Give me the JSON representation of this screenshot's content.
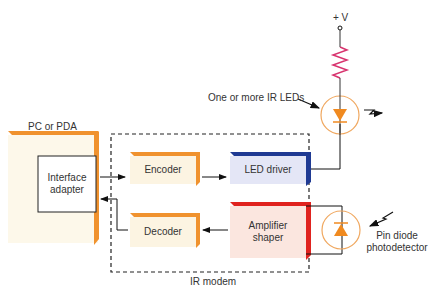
{
  "figure": {
    "pc": {
      "label": "PC or PDA",
      "fill": "#fdf8ea",
      "edge": "#f0922e"
    },
    "interface_adapter": {
      "label_line1": "Interface",
      "label_line2": "adapter"
    },
    "encoder": {
      "label": "Encoder",
      "fill": "#fcf4e2",
      "edge": "#f0922e"
    },
    "decoder": {
      "label": "Decoder",
      "fill": "#fcf4e2",
      "edge": "#f0922e"
    },
    "led_driver": {
      "label": "LED driver",
      "fill": "#e4e6f6",
      "edge": "#1f3a93"
    },
    "amplifier": {
      "label_line1": "Amplifier",
      "label_line2": "shaper",
      "fill": "#fbe6df",
      "edge": "#e0231f"
    },
    "modem": {
      "label": "IR modem"
    },
    "supply": {
      "label": "+ V"
    },
    "resistor_color": "#d8336e",
    "diode_color": "#f08a20",
    "led_callout": {
      "label": "One or more IR LEDs"
    },
    "photodetector": {
      "label_line1": "Pin diode",
      "label_line2": "photodetector"
    }
  }
}
